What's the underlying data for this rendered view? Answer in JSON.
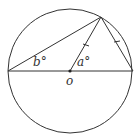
{
  "diagram": {
    "type": "circle-geometry",
    "circle": {
      "cx": 70,
      "cy": 71,
      "r": 62
    },
    "points": {
      "left": {
        "x": 8,
        "y": 71
      },
      "right": {
        "x": 133,
        "y": 71
      },
      "top": {
        "x": 101,
        "y": 17
      },
      "center": {
        "x": 70,
        "y": 71
      }
    },
    "labels": {
      "angle_b": "b°",
      "angle_a": "a°",
      "center": "o"
    },
    "equal_marks": [
      "center-top",
      "top-right"
    ],
    "stroke_color": "#333333"
  }
}
